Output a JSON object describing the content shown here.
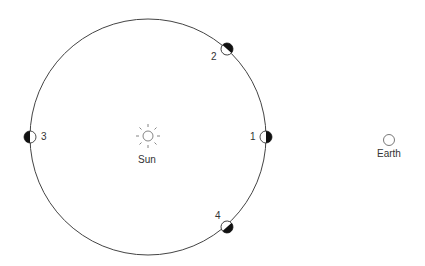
{
  "diagram": {
    "title": "",
    "sun": {
      "label": "Sun",
      "cx": 148,
      "cy": 136
    },
    "earth": {
      "label": "Earth",
      "cx": 389,
      "cy": 138
    },
    "orbit": {
      "cx": 148,
      "cy": 137,
      "r": 118
    },
    "moons": [
      {
        "label": "1",
        "cx": 266,
        "cy": 137
      },
      {
        "label": "2",
        "cx": 227,
        "cy": 49
      },
      {
        "label": "3",
        "cx": 30,
        "cy": 137
      },
      {
        "label": "4",
        "cx": 227,
        "cy": 225
      }
    ],
    "colors": {
      "line": "#333333",
      "fill_dark": "#111111",
      "fill_light": "#ffffff"
    }
  }
}
